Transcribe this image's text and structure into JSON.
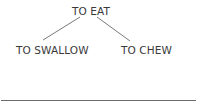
{
  "diagram": {
    "type": "tree",
    "root": {
      "label": "TO EAT"
    },
    "children": [
      {
        "label": "TO SWALLOW"
      },
      {
        "label": "TO CHEW"
      }
    ],
    "edges": [
      {
        "from": "TO EAT",
        "to": "TO SWALLOW"
      },
      {
        "from": "TO EAT",
        "to": "TO CHEW"
      }
    ]
  },
  "colors": {
    "text": "#3a3a3a",
    "line": "#6a6a6a",
    "background": "#ffffff"
  }
}
